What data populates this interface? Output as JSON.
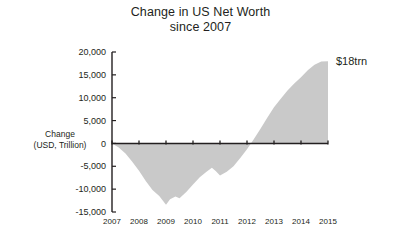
{
  "chart_data": {
    "type": "area",
    "title": "Change in US Net Worth since 2007",
    "title_line1": "Change in US Net Worth",
    "title_line2": "since 2007",
    "xlabel": "",
    "ylabel": "Change (USD, Trillion)",
    "ylabel_line1": "Change",
    "ylabel_line2": "(USD, Trillion)",
    "grid": false,
    "legend": "none",
    "xlim": [
      2007,
      2015
    ],
    "ylim": [
      -15000,
      20000
    ],
    "ytick_labels": [
      "20,000",
      "15,000",
      "10,000",
      "5,000",
      "0",
      "-5,000",
      "-10,000",
      "-15,000"
    ],
    "ytick_values": [
      20000,
      15000,
      10000,
      5000,
      0,
      -5000,
      -10000,
      -15000
    ],
    "xtick_labels": [
      "2007",
      "2008",
      "2009",
      "2010",
      "2011",
      "2012",
      "2013",
      "2014",
      "2015"
    ],
    "xtick_values": [
      2007,
      2008,
      2009,
      2010,
      2011,
      2012,
      2013,
      2014,
      2015
    ],
    "series_name": "Change in US Net Worth since 2007",
    "fill_color": "#c9c9c9",
    "axis_color": "#231f20",
    "x": [
      2007.0,
      2007.25,
      2007.5,
      2007.75,
      2008.0,
      2008.25,
      2008.5,
      2008.75,
      2009.0,
      2009.15,
      2009.35,
      2009.5,
      2009.75,
      2010.0,
      2010.25,
      2010.5,
      2010.7,
      2010.85,
      2011.0,
      2011.25,
      2011.5,
      2011.75,
      2012.0,
      2012.25,
      2012.5,
      2012.75,
      2013.0,
      2013.25,
      2013.5,
      2013.75,
      2014.0,
      2014.25,
      2014.5,
      2014.75,
      2015.0
    ],
    "values": [
      0,
      -900,
      -2200,
      -4000,
      -6000,
      -8200,
      -10200,
      -11500,
      -13400,
      -12200,
      -11600,
      -12000,
      -10600,
      -9000,
      -7400,
      -6200,
      -5300,
      -6100,
      -7000,
      -6200,
      -5000,
      -3200,
      -1300,
      900,
      3200,
      5600,
      7900,
      9800,
      11600,
      13100,
      14500,
      16000,
      17200,
      17900,
      18000
    ],
    "annotations": [
      {
        "text": "$18trn",
        "x": 2015,
        "y": 18000
      }
    ]
  }
}
